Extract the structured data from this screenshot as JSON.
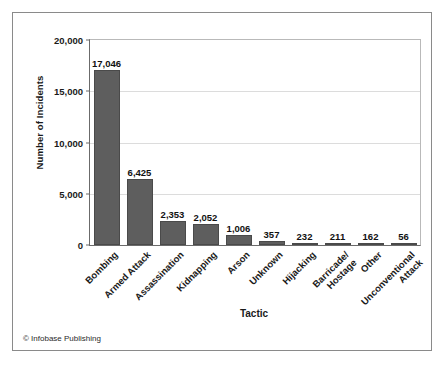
{
  "figure": {
    "credit": "© Infobase Publishing"
  },
  "chart_data": {
    "type": "bar",
    "title": "",
    "xlabel": "Tactic",
    "ylabel": "Number of Incidents",
    "ylim": [
      0,
      20000
    ],
    "yticks": [
      0,
      5000,
      10000,
      15000,
      20000
    ],
    "ytick_labels": [
      "0",
      "5,000",
      "10,000",
      "15,000",
      "20,000"
    ],
    "grid": "horizontal",
    "legend": "none",
    "bar_color": "#5e5e5e",
    "categories": [
      "Bombing",
      "Armed Attack",
      "Assassination",
      "Kidnapping",
      "Arson",
      "Unknown",
      "Hijacking",
      "Barricade/\nHostage",
      "Other",
      "Unconventional\nAttack"
    ],
    "category_lines": [
      [
        "Bombing"
      ],
      [
        "Armed Attack"
      ],
      [
        "Assassination"
      ],
      [
        "Kidnapping"
      ],
      [
        "Arson"
      ],
      [
        "Unknown"
      ],
      [
        "Hijacking"
      ],
      [
        "Barricade/",
        "Hostage"
      ],
      [
        "Other"
      ],
      [
        "Unconventional",
        "Attack"
      ]
    ],
    "values": [
      17046,
      6425,
      2353,
      2052,
      1006,
      357,
      232,
      211,
      162,
      56
    ],
    "value_labels": [
      "17,046",
      "6,425",
      "2,353",
      "2,052",
      "1,006",
      "357",
      "232",
      "211",
      "162",
      "56"
    ]
  }
}
